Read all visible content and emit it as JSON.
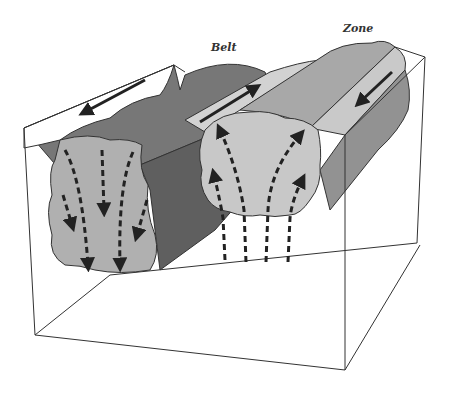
{
  "diagram": {
    "labels": {
      "belt": "Belt",
      "zone": "Zone"
    },
    "colors": {
      "box_line": "#333333",
      "belt_top": "#7a7a7a",
      "belt_side": "#5e5e5e",
      "belt_face": "#b0b0b0",
      "zone_top": "#a4a4a4",
      "zone_side": "#8a8a8a",
      "zone_face": "#c8c8c8",
      "trough": "#cfcfcf",
      "arrow": "#222222"
    },
    "elements": [
      {
        "name": "belt-block",
        "description": "downwelling block with downward dashed arrows"
      },
      {
        "name": "zone-block",
        "description": "upwelling block with upward dashed arrows"
      },
      {
        "name": "surface-arrow-left",
        "direction": "left"
      },
      {
        "name": "surface-arrow-center",
        "direction": "up-right"
      },
      {
        "name": "surface-arrow-right",
        "direction": "down-left"
      }
    ]
  }
}
